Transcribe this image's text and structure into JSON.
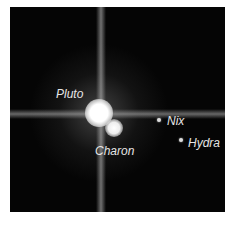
{
  "image": {
    "description": "Hubble image of Pluto and its moons",
    "labels": {
      "pluto": "Pluto",
      "charon": "Charon",
      "nix": "Nix",
      "hydra": "Hydra"
    }
  }
}
